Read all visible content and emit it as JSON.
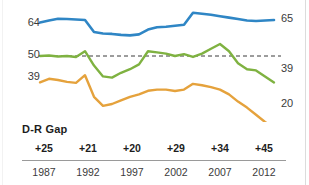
{
  "chart_data": {
    "type": "line",
    "title": "",
    "subtitle": "",
    "xlabel": "",
    "ylabel": "",
    "grid": false,
    "legend": false,
    "xlim": [
      1987,
      2013
    ],
    "ylim": [
      15,
      70
    ],
    "reference_line": {
      "value": 50,
      "style": "dashed",
      "color": "#3a3a3a"
    },
    "axis_tick_labels": {
      "left": [
        "64",
        "50",
        "39"
      ],
      "right": [
        "65",
        "39",
        "20"
      ]
    },
    "x_tick_labels": [
      "1987",
      "1992",
      "1997",
      "2002",
      "2007",
      "2012"
    ],
    "series": [
      {
        "name": "blue-line",
        "color": "#2f86c5",
        "start_label": "64",
        "end_label": "65",
        "x": [
          1987,
          1988,
          1989,
          1990,
          1991,
          1992,
          1993,
          1994,
          1995,
          1996,
          1997,
          1998,
          1999,
          2000,
          2001,
          2002,
          2003,
          2004,
          2005,
          2006,
          2007,
          2008,
          2009,
          2010,
          2011,
          2012,
          2013
        ],
        "values": [
          64,
          64.8,
          65.5,
          65.4,
          65.2,
          65.0,
          60.0,
          59.4,
          59.2,
          58.8,
          58.6,
          59.0,
          61.0,
          62.0,
          62.2,
          62.6,
          63.0,
          68.0,
          67.6,
          67.2,
          66.6,
          66.0,
          65.4,
          64.8,
          64.6,
          64.8,
          65
        ]
      },
      {
        "name": "green-line",
        "color": "#7fb241",
        "start_label": "50",
        "end_label": "39",
        "x": [
          1987,
          1988,
          1989,
          1990,
          1991,
          1992,
          1993,
          1994,
          1995,
          1996,
          1997,
          1998,
          1999,
          2000,
          2001,
          2002,
          2003,
          2004,
          2005,
          2006,
          2007,
          2008,
          2009,
          2010,
          2011,
          2012,
          2013
        ],
        "values": [
          50.0,
          50.2,
          49.8,
          50.0,
          49.6,
          52.0,
          46.0,
          41.5,
          41.0,
          43.0,
          44.5,
          46.5,
          52.0,
          51.5,
          51.0,
          50.0,
          50.8,
          49.6,
          51.0,
          53.0,
          55.0,
          52.0,
          47.0,
          44.5,
          44.0,
          41.5,
          39
        ]
      },
      {
        "name": "orange-line",
        "color": "#e5a23c",
        "start_label": "39",
        "end_label": "20",
        "x": [
          1987,
          1988,
          1989,
          1990,
          1991,
          1992,
          1993,
          1994,
          1995,
          1996,
          1997,
          1998,
          1999,
          2000,
          2001,
          2002,
          2003,
          2004,
          2005,
          2006,
          2007,
          2008,
          2009,
          2010,
          2011,
          2012,
          2013
        ],
        "values": [
          39.0,
          40.5,
          40.0,
          39.2,
          38.8,
          42.0,
          33.0,
          29.2,
          30.0,
          31.5,
          33.0,
          34.0,
          35.5,
          36.0,
          36.0,
          35.4,
          36.0,
          38.4,
          37.8,
          37.0,
          36.0,
          34.0,
          31.0,
          28.5,
          25.5,
          22.5,
          20
        ]
      }
    ],
    "gap_row": {
      "label": "D-R Gap",
      "values": [
        "+25",
        "+21",
        "+20",
        "+29",
        "+34",
        "+45"
      ]
    }
  }
}
